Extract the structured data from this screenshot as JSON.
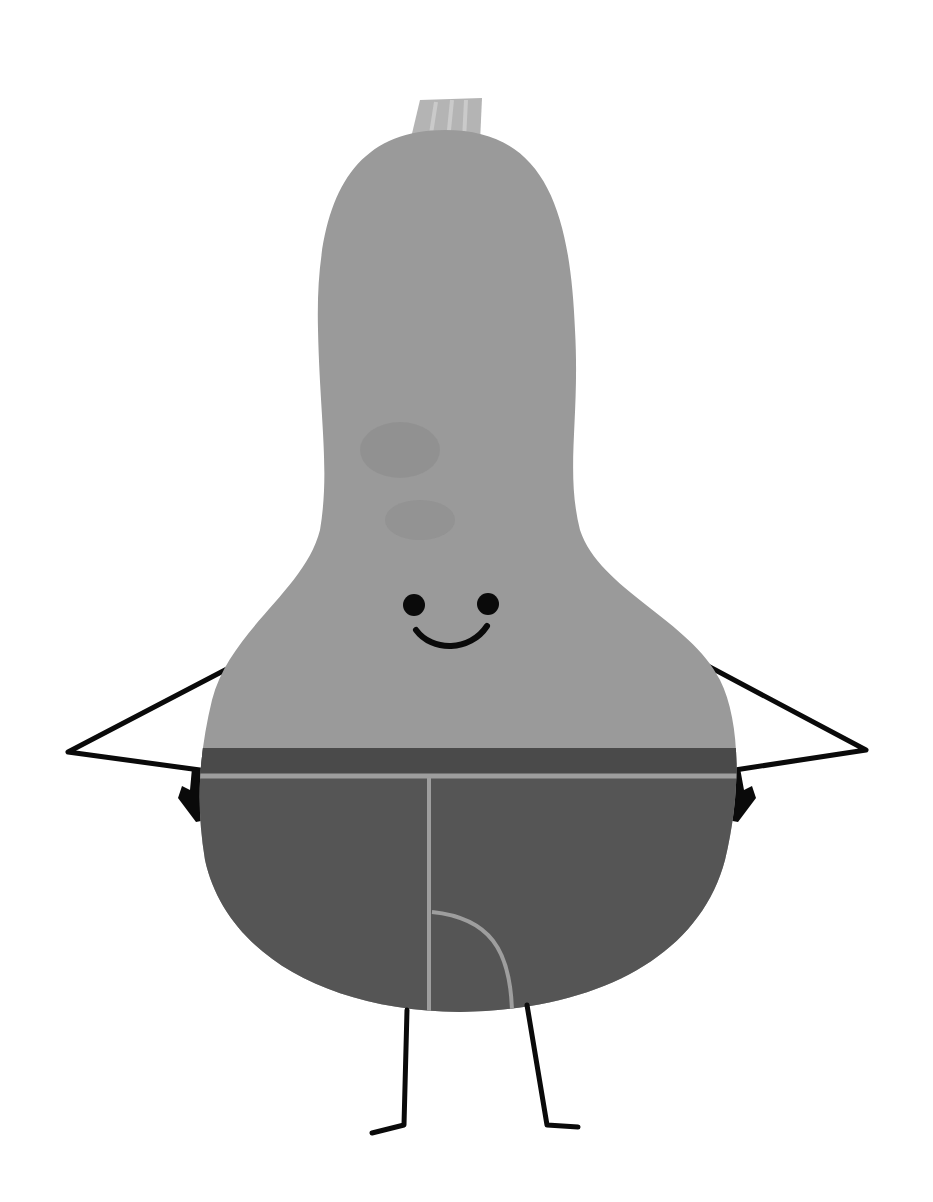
{
  "image": {
    "subject": "Cartoon butternut squash character wearing underwear, hands on hips, smiling",
    "style": "grayscale flat illustration with paper texture",
    "colors": {
      "background": "#ffffff",
      "squash_body": "#9a9a9a",
      "squash_texture": "#8c8c8c",
      "stem": "#b4b4b4",
      "stem_stripes": "#c8c8c8",
      "underwear": "#555555",
      "waistband": "#4a4a4a",
      "seam": "#9e9e9e",
      "limbs_and_face": "#0a0a0a"
    },
    "caption": "Smiling butternut squash in underwear"
  }
}
